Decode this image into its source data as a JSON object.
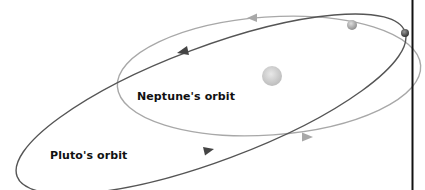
{
  "labels": {
    "neptune_orbit": "Neptune's orbit",
    "pluto_orbit": "Pluto's orbit"
  },
  "colors": {
    "background": "#ffffff",
    "neptune_orbit": "#a8a8a8",
    "pluto_orbit": "#555555",
    "sun": "#cfcfcf",
    "divider": "#111111",
    "label": "#111111"
  },
  "bodies": {
    "sun": {
      "cx": 272,
      "cy": 76,
      "r": 10
    },
    "neptune": {
      "cx": 352,
      "cy": 25,
      "r": 5
    },
    "pluto": {
      "cx": 405,
      "cy": 33,
      "r": 4
    }
  }
}
